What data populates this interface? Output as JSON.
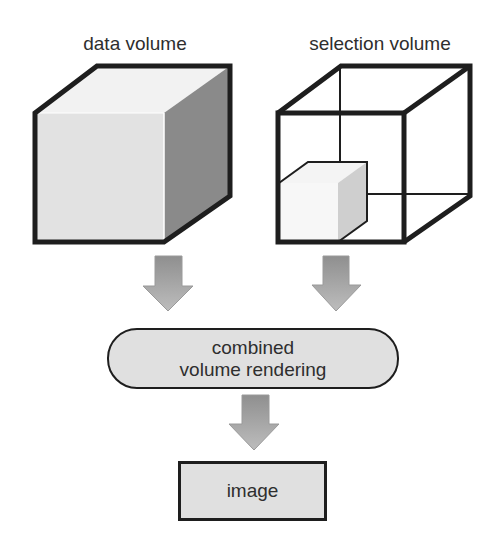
{
  "diagram": {
    "inputs": [
      {
        "label": "data volume",
        "shape": "solid-cube"
      },
      {
        "label": "selection volume",
        "shape": "wireframe-cube-with-subcube"
      }
    ],
    "process": {
      "line1": "combined",
      "line2": "volume rendering",
      "shape": "rounded-pill"
    },
    "output": {
      "label": "image",
      "shape": "rectangle"
    },
    "edges": [
      {
        "from": "data volume",
        "to": "combined volume rendering"
      },
      {
        "from": "selection volume",
        "to": "combined volume rendering"
      },
      {
        "from": "combined volume rendering",
        "to": "image"
      }
    ],
    "colors": {
      "stroke": "#1e1e1e",
      "cube_front": "#e2e2e2",
      "cube_top": "#f2f2f2",
      "cube_side": "#8a8a8a",
      "subcube_front": "#f7f7f7",
      "subcube_side": "#cfcfcf",
      "arrow_fill": "#a8a8a8",
      "node_fill": "#e0e0e0",
      "text": "#2e2e2e"
    }
  }
}
